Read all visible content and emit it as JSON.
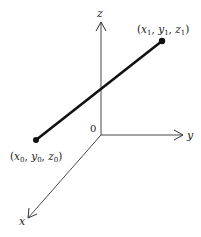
{
  "diagram": {
    "title": "",
    "axes": {
      "z": {
        "label": "z"
      },
      "y": {
        "label": "y"
      },
      "x": {
        "label": "x"
      },
      "origin": {
        "label": "0"
      }
    },
    "segment": {
      "start": {
        "label_x": "x",
        "label_y": "y",
        "label_z": "z",
        "sub": "0"
      },
      "end": {
        "label_x": "x",
        "label_y": "y",
        "label_z": "z",
        "sub": "1"
      }
    },
    "colors": {
      "axis": "#333333",
      "segment": "#111111",
      "background": "#ffffff"
    }
  }
}
